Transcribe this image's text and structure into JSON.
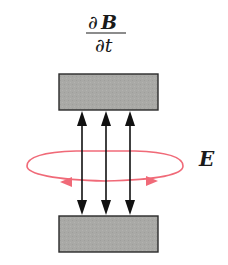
{
  "diagram": {
    "title_numerator_partial": "∂",
    "title_numerator_symbol": "B",
    "title_denominator": "∂t",
    "field_label": "E",
    "plate_color": "#a9a9a6",
    "plate_border_color": "#2a2a2a",
    "field_line_color": "#111111",
    "loop_color": "#f06a78",
    "field_lines": [
      {
        "name": "left",
        "arrows": "both"
      },
      {
        "name": "middle",
        "arrows": "both"
      },
      {
        "name": "right",
        "arrows": "both"
      }
    ]
  }
}
